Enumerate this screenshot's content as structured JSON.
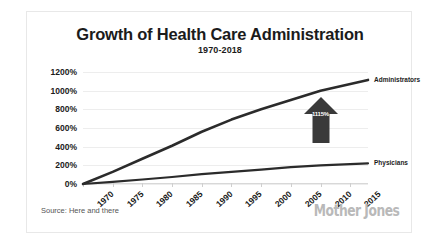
{
  "chart_data": {
    "type": "line",
    "title": "Growth of Health Care Administration",
    "subtitle": "1970-2018",
    "xlabel": "",
    "ylabel": "",
    "xlim": [
      1970,
      2018
    ],
    "ylim": [
      0,
      1200
    ],
    "grid": true,
    "legend_position": "right-inline",
    "x_ticks": [
      "1970",
      "1975",
      "1980",
      "1985",
      "1990",
      "1995",
      "2000",
      "2005",
      "2010",
      "2015"
    ],
    "x_tick_values": [
      1970,
      1975,
      1980,
      1985,
      1990,
      1995,
      2000,
      2005,
      2010,
      2015
    ],
    "y_ticks": [
      "0%",
      "200%",
      "400%",
      "600%",
      "800%",
      "1000%",
      "1200%"
    ],
    "y_tick_values": [
      0,
      200,
      400,
      600,
      800,
      1000,
      1200
    ],
    "x": [
      1970,
      1975,
      1980,
      1985,
      1990,
      1995,
      2000,
      2005,
      2010,
      2018
    ],
    "series": [
      {
        "name": "Administrators",
        "color": "#2b2b2b",
        "values": [
          0,
          130,
          270,
          410,
          560,
          690,
          800,
          900,
          1000,
          1115
        ]
      },
      {
        "name": "Physicians",
        "color": "#2b2b2b",
        "values": [
          0,
          22,
          48,
          75,
          105,
          130,
          155,
          180,
          200,
          222
        ]
      }
    ],
    "annotations": [
      {
        "name": "growth-arrow",
        "label": "1115%",
        "shape": "up-arrow",
        "color": "#3a3a3a"
      }
    ],
    "source": "Source: Here and there",
    "credit": "Mother Jones"
  },
  "colors": {
    "line": "#2b2b2b",
    "grid": "#ededed",
    "axis": "#d8d8d8",
    "text": "#1b1b1b",
    "arrow": "#3a3a3a",
    "logo": "#b9b9b9",
    "card_border": "#e8e8e8",
    "background": "#ffffff"
  }
}
